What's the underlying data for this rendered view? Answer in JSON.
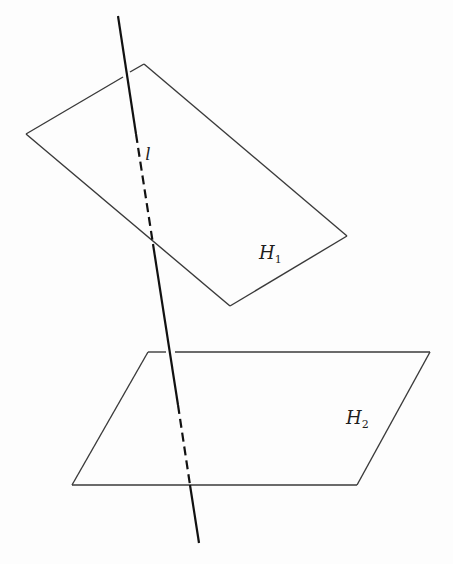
{
  "figure": {
    "line": {
      "label": "l",
      "solid_top": {
        "x1": 118,
        "y1": 16,
        "x2": 136,
        "y2": 134
      },
      "dashed_mid_upper": {
        "x1": 136,
        "y1": 134,
        "x2": 153,
        "y2": 244
      },
      "solid_mid": {
        "x1": 153,
        "y1": 244,
        "x2": 177,
        "y2": 400
      },
      "dashed_mid_lower": {
        "x1": 177,
        "y1": 400,
        "x2": 190,
        "y2": 485
      },
      "solid_bottom": {
        "x1": 190,
        "y1": 485,
        "x2": 200,
        "y2": 543
      }
    },
    "planes": [
      {
        "name": "H1",
        "label_main": "H",
        "label_sub": "1",
        "points": "26,134 144,64 347,236 230,306",
        "gap_note": "edge 26,134 to 144,64 broken where line l passes in front"
      },
      {
        "name": "H2",
        "label_main": "H",
        "label_sub": "2",
        "points": "72,485 148,352 430,352 357,485",
        "gap_note": "top edge broken where line l passes in front"
      }
    ],
    "stroke_color": "#2a2a2a",
    "line_color": "#111111"
  }
}
